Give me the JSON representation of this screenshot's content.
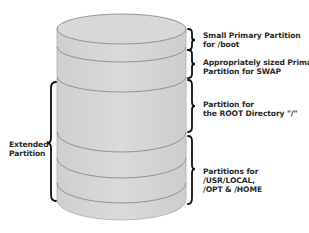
{
  "diagram": {
    "type": "disk-partition-layout",
    "colors": {
      "cylinder_fill": "#d6d6d6",
      "partition_line": "#8a8a8a",
      "brace": "#111111",
      "text": "#2a2a2a"
    },
    "partitions": [
      {
        "id": "boot",
        "lines": [
          "Small Primary Partition",
          "for /boot"
        ]
      },
      {
        "id": "swap",
        "lines": [
          "Appropriately sized Primary",
          "Partition for SWAP"
        ]
      },
      {
        "id": "root",
        "lines": [
          "Partition for",
          "the ROOT Directory \"/\""
        ]
      },
      {
        "id": "usr",
        "lines": [
          "Partitions for",
          "/USR/LOCAL,",
          "/OPT & /HOME"
        ]
      }
    ],
    "extended": {
      "lines": [
        "Extended",
        "Partition"
      ]
    }
  }
}
